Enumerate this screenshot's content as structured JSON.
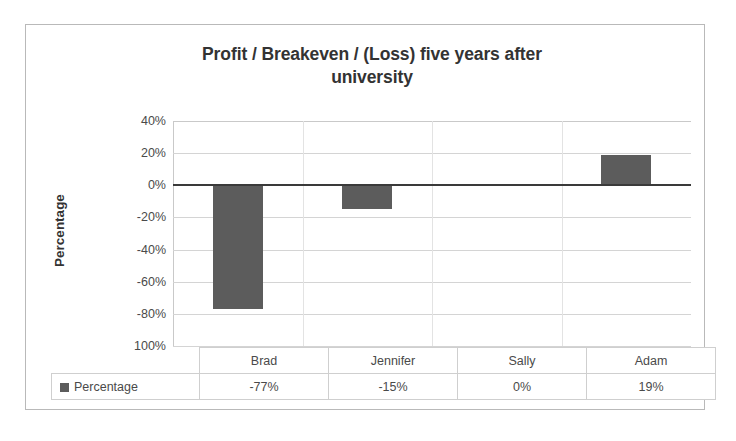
{
  "chart_data": {
    "type": "bar",
    "title": "Profit / Breakeven / (Loss) five years after university",
    "xlabel": "",
    "ylabel": "Percentage",
    "categories": [
      "Brad",
      "Jennifer",
      "Sally",
      "Adam"
    ],
    "values": [
      -77,
      -15,
      0,
      19
    ],
    "value_labels": [
      "-77%",
      "-15%",
      "0%",
      "19%"
    ],
    "series": [
      {
        "name": "Percentage",
        "values": [
          -77,
          -15,
          0,
          19
        ]
      }
    ],
    "ylim": [
      -100,
      40
    ],
    "ytick_values": [
      40,
      20,
      0,
      -20,
      -40,
      -60,
      -80,
      -100
    ],
    "ytick_labels": [
      "40%",
      "20%",
      "0%",
      "-20%",
      "-40%",
      "-60%",
      "-80%",
      "100%"
    ],
    "grid": true,
    "legend_position": "data-table",
    "bar_color": "#5c5c5c",
    "zero_line_color": "#3a3a3a",
    "gridline_color": "#d4d4d4"
  },
  "title": {
    "line1": "Profit / Breakeven / (Loss) five years after",
    "line2": "university"
  },
  "axis": {
    "y_title": "Percentage"
  },
  "table": {
    "series_label": "Percentage",
    "headers": [
      "Brad",
      "Jennifer",
      "Sally",
      "Adam"
    ],
    "values": [
      "-77%",
      "-15%",
      "0%",
      "19%"
    ]
  }
}
